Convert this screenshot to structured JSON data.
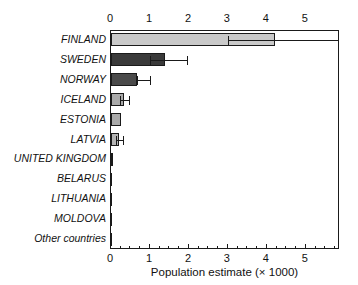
{
  "chart_data": {
    "type": "bar",
    "orientation": "horizontal",
    "title": "",
    "xlabel": "Population estimate (× 1000)",
    "ylabel": "",
    "xlim": [
      0,
      5.85
    ],
    "ylim": null,
    "grid": false,
    "legend": null,
    "xticks": [
      0,
      1,
      2,
      3,
      4,
      5
    ],
    "xticklabels": [
      "0",
      "1",
      "2",
      "3",
      "4",
      "5"
    ],
    "minor_tick_step": 0.25,
    "axis_positions": [
      "top",
      "bottom"
    ],
    "categories": [
      "FINLAND",
      "SWEDEN",
      "NORWAY",
      "ICELAND",
      "ESTONIA",
      "LATVIA",
      "UNITED KINGDOM",
      "BELARUS",
      "LITHUANIA",
      "MOLDOVA",
      "Other countries"
    ],
    "values": [
      4.2,
      1.38,
      0.67,
      0.33,
      0.26,
      0.21,
      0.05,
      0.0,
      0.0,
      0.0,
      0.0
    ],
    "error_low": [
      3.0,
      1.0,
      0.67,
      0.22,
      null,
      0.13,
      null,
      null,
      null,
      null,
      null
    ],
    "error_high": [
      5.85,
      1.95,
      1.0,
      0.47,
      null,
      0.3,
      null,
      null,
      null,
      null,
      null
    ],
    "bar_colors": [
      "#c9c9c9",
      "#3a3a3a",
      "#4a4a4a",
      "#a9a9a9",
      "#a9a9a9",
      "#b4b4b4",
      "#8f8f8f",
      "#8f8f8f",
      "#8f8f8f",
      "#8f8f8f",
      "#8f8f8f"
    ],
    "edge_color": "#1a1a1a",
    "error_color": "#1a1a1a"
  },
  "colors": {
    "background": "#ffffff",
    "axis": "#1a1a1a",
    "text": "#111111"
  }
}
